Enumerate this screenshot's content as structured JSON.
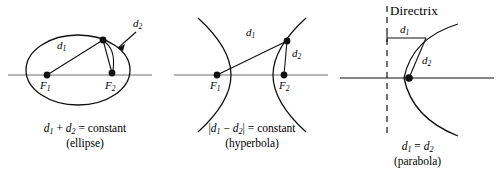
{
  "figure": {
    "background_color": "#ffffff",
    "stroke_color": "#000000",
    "axis_color": "#6e6e6e"
  },
  "panels": [
    {
      "id": "ellipse",
      "name": "Ellipse",
      "focus_1_label": "F",
      "focus_1_sub": "1",
      "focus_2_label": "F",
      "focus_2_sub": "2",
      "d1_label": "d",
      "d1_sub": "1",
      "d2_label": "d",
      "d2_sub": "2",
      "caption_line1_pre": "d",
      "caption_line1_sub1": "1",
      "caption_line1_mid": " + ",
      "caption_line1_var2": "d",
      "caption_line1_sub2": "2",
      "caption_line1_post": " = constant",
      "caption_line2": "(ellipse)"
    },
    {
      "id": "hyperbola",
      "name": "Hyperbola",
      "focus_1_label": "F",
      "focus_1_sub": "1",
      "focus_2_label": "F",
      "focus_2_sub": "2",
      "d1_label": "d",
      "d1_sub": "1",
      "d2_label": "d",
      "d2_sub": "2",
      "caption_line1_open": "|",
      "caption_line1_pre": "d",
      "caption_line1_sub1": "1",
      "caption_line1_mid": " − ",
      "caption_line1_var2": "d",
      "caption_line1_sub2": "2",
      "caption_line1_close": "|",
      "caption_line1_post": " = constant",
      "caption_line2": "(hyperbola)"
    },
    {
      "id": "parabola",
      "name": "Parabola",
      "directrix_label": "Directrix",
      "d1_label": "d",
      "d1_sub": "1",
      "d2_label": "d",
      "d2_sub": "2",
      "caption_line1_pre": "d",
      "caption_line1_sub1": "1",
      "caption_line1_mid": " = ",
      "caption_line1_var2": "d",
      "caption_line1_sub2": "2",
      "caption_line2": "(parabola)"
    }
  ]
}
